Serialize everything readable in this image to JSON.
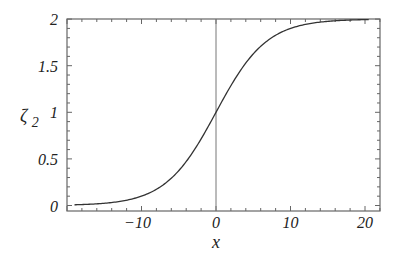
{
  "chart_data": {
    "type": "line",
    "title": "",
    "xlabel": "x",
    "ylabel": "ζ2",
    "ylabel_main": "ζ",
    "ylabel_sub": "2",
    "xlim": [
      -20,
      22
    ],
    "ylim": [
      -0.02,
      2.0
    ],
    "x_ticks": [
      -10,
      0,
      10,
      20
    ],
    "x_tick_labels": [
      "−10",
      "0",
      "10",
      "20"
    ],
    "y_ticks": [
      0,
      0.5,
      1,
      1.5,
      2
    ],
    "y_tick_labels": [
      "0",
      "0.5",
      "1",
      "1.5",
      "2"
    ],
    "grid": false,
    "vertical_reference_line_at_x": 0,
    "series": [
      {
        "name": "ζ2",
        "function": "1 + tanh(x/6.8)",
        "x": [
          -19,
          -15,
          -12,
          -10,
          -8,
          -6,
          -4,
          -2,
          0,
          2,
          4,
          6,
          8,
          10,
          12,
          15,
          18,
          20.5
        ],
        "y": [
          0.007,
          0.024,
          0.057,
          0.1,
          0.17,
          0.29,
          0.47,
          0.71,
          1.0,
          1.29,
          1.53,
          1.71,
          1.83,
          1.9,
          1.94,
          1.976,
          1.99,
          1.995
        ]
      }
    ]
  }
}
